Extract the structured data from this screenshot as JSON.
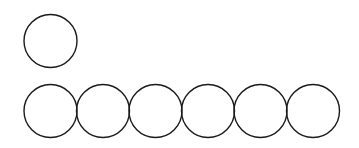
{
  "diagram": {
    "stroke_color": "#1a1a1a",
    "background": "#ffffff",
    "top_row": [
      {
        "cx": 50.5,
        "cy": 41,
        "r": 26.5
      }
    ],
    "bottom_row": [
      {
        "cx": 50.5,
        "cy": 111,
        "r": 26.5
      },
      {
        "cx": 103,
        "cy": 111,
        "r": 26.5
      },
      {
        "cx": 155.5,
        "cy": 111,
        "r": 26.5
      },
      {
        "cx": 208,
        "cy": 111,
        "r": 26.5
      },
      {
        "cx": 260.5,
        "cy": 111,
        "r": 26.5
      },
      {
        "cx": 313,
        "cy": 111,
        "r": 26.5
      }
    ]
  }
}
